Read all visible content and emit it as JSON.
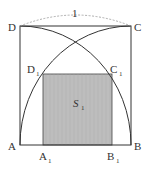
{
  "diagram": {
    "labels": {
      "A": "A",
      "B": "B",
      "C": "C",
      "D": "D",
      "A1": "A",
      "B1": "B",
      "C1": "C",
      "D1": "D",
      "sub1": "1",
      "side_length": "1",
      "area": "S",
      "area_sub": "1"
    },
    "colors": {
      "stroke": "#333333",
      "shade": "#b8b8b8",
      "dashed": "#999999"
    }
  }
}
